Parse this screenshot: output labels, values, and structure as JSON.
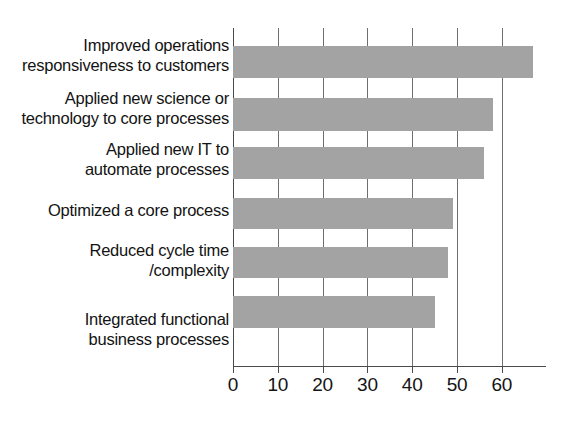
{
  "chart_data": {
    "type": "bar",
    "orientation": "horizontal",
    "title": "",
    "subtitle": "",
    "xlabel": "",
    "ylabel": "",
    "categories": [
      "Improved operations responsiveness to customers",
      "Applied new science or technology to core processes",
      "Applied new IT to automate processes",
      "Optimized a core process",
      "Reduced cycle time /complexity",
      "Integrated functional business processes"
    ],
    "category_lines": [
      [
        "Improved operations",
        "responsiveness to customers"
      ],
      [
        "Applied new science or",
        "technology to core processes"
      ],
      [
        "Applied new IT to",
        "automate processes"
      ],
      [
        "Optimized a core process"
      ],
      [
        "Reduced cycle time",
        "/complexity"
      ],
      [
        "Integrated functional",
        "business processes"
      ]
    ],
    "values": [
      67,
      58,
      56,
      49,
      48,
      45
    ],
    "xlim": [
      0,
      70
    ],
    "xticks": [
      0,
      10,
      20,
      30,
      40,
      50,
      60
    ],
    "xtick_labels": [
      "0",
      "10",
      "20",
      "30",
      "40",
      "50",
      "60"
    ],
    "grid": true,
    "grid_axis": "x",
    "legend": false,
    "bar_color": "#a3a3a3",
    "axis_color": "#4a4a4a",
    "grid_color": "#6f6f6f",
    "background_color": "#ffffff",
    "text_color": "#131313"
  }
}
